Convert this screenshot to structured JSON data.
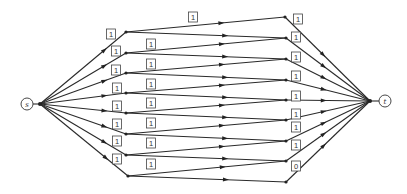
{
  "graph": {
    "source": {
      "label": "s",
      "x": 27,
      "y": 104
    },
    "sink": {
      "label": "t",
      "x": 385,
      "y": 101
    },
    "hub_s": {
      "x": 40,
      "y": 104
    },
    "hub_t": {
      "x": 370,
      "y": 101
    },
    "left_nodes": [
      {
        "x": 126,
        "y": 32
      },
      {
        "x": 126,
        "y": 53
      },
      {
        "x": 126,
        "y": 73
      },
      {
        "x": 126,
        "y": 93
      },
      {
        "x": 126,
        "y": 113
      },
      {
        "x": 126,
        "y": 134
      },
      {
        "x": 126,
        "y": 155
      },
      {
        "x": 128,
        "y": 176
      }
    ],
    "right_nodes": [
      {
        "x": 285,
        "y": 17
      },
      {
        "x": 286,
        "y": 38
      },
      {
        "x": 286,
        "y": 59
      },
      {
        "x": 286,
        "y": 80
      },
      {
        "x": 286,
        "y": 100
      },
      {
        "x": 286,
        "y": 120
      },
      {
        "x": 286,
        "y": 141
      },
      {
        "x": 286,
        "y": 161
      },
      {
        "x": 286,
        "y": 182
      }
    ],
    "source_edge_labels": [
      {
        "text": "1",
        "x": 111,
        "y": 34
      },
      {
        "text": "1",
        "x": 116,
        "y": 51
      },
      {
        "text": "1",
        "x": 116,
        "y": 70
      },
      {
        "text": "1",
        "x": 117,
        "y": 88
      },
      {
        "text": "1",
        "x": 117,
        "y": 106
      },
      {
        "text": "1",
        "x": 117,
        "y": 124
      },
      {
        "text": "1",
        "x": 117,
        "y": 141
      },
      {
        "text": "1",
        "x": 117,
        "y": 159
      }
    ],
    "middle_edge_labels": [
      {
        "text": "1",
        "x": 193,
        "y": 17
      },
      {
        "text": "1",
        "x": 151,
        "y": 44
      },
      {
        "text": "1",
        "x": 151,
        "y": 64
      },
      {
        "text": "1",
        "x": 151,
        "y": 84
      },
      {
        "text": "1",
        "x": 151,
        "y": 103
      },
      {
        "text": "1",
        "x": 151,
        "y": 123
      },
      {
        "text": "1",
        "x": 151,
        "y": 143
      },
      {
        "text": "1",
        "x": 151,
        "y": 164
      }
    ],
    "sink_edge_labels": [
      {
        "text": "1",
        "x": 298,
        "y": 19
      },
      {
        "text": "1",
        "x": 296,
        "y": 37
      },
      {
        "text": "1",
        "x": 296,
        "y": 57
      },
      {
        "text": "1",
        "x": 296,
        "y": 76
      },
      {
        "text": "1",
        "x": 296,
        "y": 96
      },
      {
        "text": "1",
        "x": 296,
        "y": 114
      },
      {
        "text": "1",
        "x": 296,
        "y": 127
      },
      {
        "text": "1",
        "x": 296,
        "y": 145
      },
      {
        "text": "0",
        "x": 296,
        "y": 166
      }
    ]
  }
}
